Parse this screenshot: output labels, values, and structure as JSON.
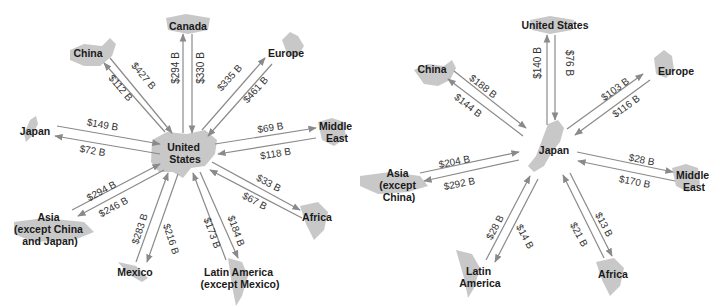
{
  "diagrams": [
    {
      "hub": "United States",
      "flows": [
        {
          "partner": "China",
          "to_hub": "$427 B",
          "from_hub": "$112 B"
        },
        {
          "partner": "Canada",
          "to_hub": "$330 B",
          "from_hub": "$294 B"
        },
        {
          "partner": "Europe",
          "to_hub": "$461 B",
          "from_hub": "$335 B"
        },
        {
          "partner": "Japan",
          "to_hub": "$149 B",
          "from_hub": "$72 B"
        },
        {
          "partner": "Middle East",
          "to_hub": "$118 B",
          "from_hub": "$69 B"
        },
        {
          "partner": "Asia (except China and Japan)",
          "to_hub": "$294 B",
          "from_hub": "$246 B"
        },
        {
          "partner": "Africa",
          "to_hub": "$67 B",
          "from_hub": "$33 B"
        },
        {
          "partner": "Mexico",
          "to_hub": "$283 B",
          "from_hub": "$216 B"
        },
        {
          "partner": "Latin America (except Mexico)",
          "to_hub": "$173 B",
          "from_hub": "$184 B"
        }
      ]
    },
    {
      "hub": "Japan",
      "flows": [
        {
          "partner": "United States",
          "to_hub": "$76 B",
          "from_hub": "$140 B"
        },
        {
          "partner": "China",
          "to_hub": "$188 B",
          "from_hub": "$144 B"
        },
        {
          "partner": "Europe",
          "to_hub": "$116 B",
          "from_hub": "$103 B"
        },
        {
          "partner": "Asia (except China)",
          "to_hub": "$204 B",
          "from_hub": "$292 B"
        },
        {
          "partner": "Middle East",
          "to_hub": "$170 B",
          "from_hub": "$28 B"
        },
        {
          "partner": "Latin America",
          "to_hub": "$14 B",
          "from_hub": "$28 B"
        },
        {
          "partner": "Africa",
          "to_hub": "$13 B",
          "from_hub": "$21 B"
        }
      ]
    }
  ],
  "left": {
    "hub": [
      "United",
      "States"
    ],
    "china": "China",
    "canada": "Canada",
    "europe": "Europe",
    "japan": "Japan",
    "middle_east": [
      "Middle",
      "East"
    ],
    "asia": [
      "Asia",
      "(except China",
      "and Japan)"
    ],
    "africa": "Africa",
    "mexico": "Mexico",
    "latam": [
      "Latin America",
      "(except Mexico)"
    ],
    "v_china_in": "$427 B",
    "v_china_out": "$112 B",
    "v_canada_out": "$294 B",
    "v_canada_in": "$330 B",
    "v_europe_out": "$335 B",
    "v_europe_in": "$461 B",
    "v_japan_in": "$149 B",
    "v_japan_out": "$72 B",
    "v_me_out": "$69 B",
    "v_me_in": "$118 B",
    "v_asia_in": "$294 B",
    "v_asia_out": "$246 B",
    "v_africa_out": "$33 B",
    "v_africa_in": "$67 B",
    "v_mexico_in": "$283 B",
    "v_mexico_out": "$216 B",
    "v_latam_in": "$173 B",
    "v_latam_out": "$184 B"
  },
  "right": {
    "hub": "Japan",
    "us": "United States",
    "china": "China",
    "europe": "Europe",
    "asia": [
      "Asia",
      "(except",
      "China)"
    ],
    "middle_east": [
      "Middle",
      "East"
    ],
    "latam": [
      "Latin",
      "America"
    ],
    "africa": "Africa",
    "v_us_out": "$140 B",
    "v_us_in": "$76 B",
    "v_china_in": "$188 B",
    "v_china_out": "$144 B",
    "v_europe_out": "$103 B",
    "v_europe_in": "$116 B",
    "v_asia_in": "$204 B",
    "v_asia_out": "$292 B",
    "v_me_out": "$28 B",
    "v_me_in": "$170 B",
    "v_latam_in": "$28 B",
    "v_latam_out": "$14 B",
    "v_africa_in": "$21 B",
    "v_africa_out": "$13 B"
  }
}
